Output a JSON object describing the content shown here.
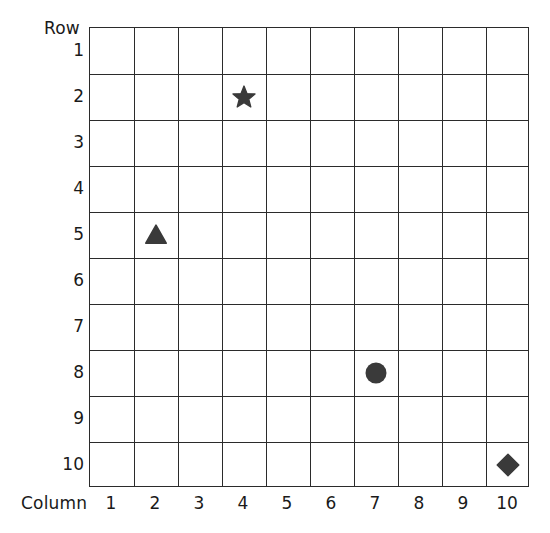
{
  "axes": {
    "row_caption": "Row",
    "column_caption": "Column",
    "row_labels": [
      "1",
      "2",
      "3",
      "4",
      "5",
      "6",
      "7",
      "8",
      "9",
      "10"
    ],
    "column_labels": [
      "1",
      "2",
      "3",
      "4",
      "5",
      "6",
      "7",
      "8",
      "9",
      "10"
    ]
  },
  "colors": {
    "grid_line": "#2b2b2b",
    "marker_fill": "#3a3a3a",
    "text": "#1a1a1a",
    "background": "#ffffff"
  },
  "chart_data": {
    "type": "scatter",
    "title": "",
    "xlabel": "Column",
    "ylabel": "Row",
    "grid": true,
    "legend": "none",
    "x": [
      4,
      2,
      7,
      10
    ],
    "y": [
      2,
      5,
      8,
      10
    ],
    "categories": [
      "1",
      "2",
      "3",
      "4",
      "5",
      "6",
      "7",
      "8",
      "9",
      "10"
    ],
    "xlim": [
      0.5,
      10.5
    ],
    "ylim": [
      0.5,
      10.5
    ],
    "x_tick_labels": [
      "1",
      "2",
      "3",
      "4",
      "5",
      "6",
      "7",
      "8",
      "9",
      "10"
    ],
    "y_tick_labels": [
      "1",
      "2",
      "3",
      "4",
      "5",
      "6",
      "7",
      "8",
      "9",
      "10"
    ],
    "y_axis_inverted": true,
    "markers": [
      {
        "shape": "star",
        "column": 4,
        "row": 2,
        "label": "star-marker"
      },
      {
        "shape": "triangle",
        "column": 2,
        "row": 5,
        "label": "triangle-marker"
      },
      {
        "shape": "circle",
        "column": 7,
        "row": 8,
        "label": "circle-marker"
      },
      {
        "shape": "diamond",
        "column": 10,
        "row": 10,
        "label": "diamond-marker"
      }
    ]
  }
}
